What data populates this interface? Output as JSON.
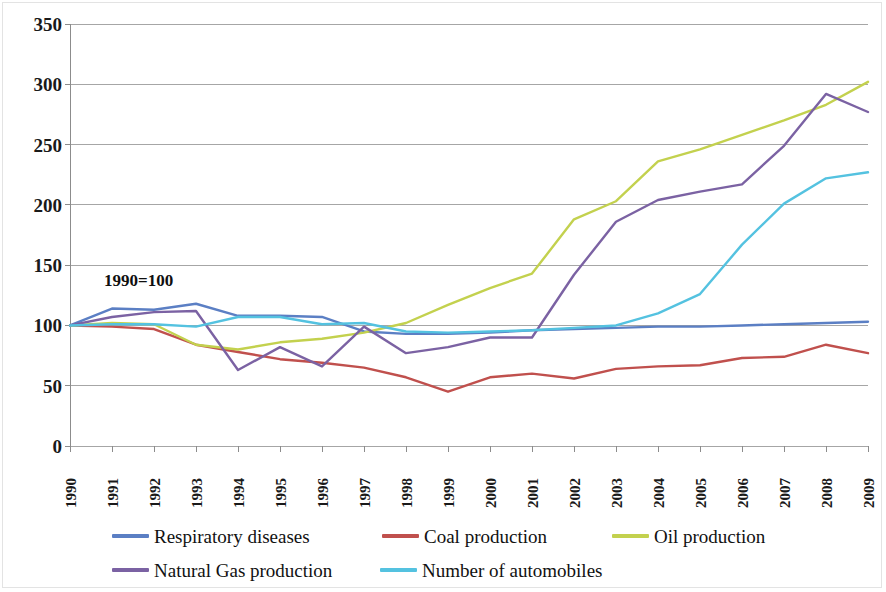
{
  "chart_data": {
    "type": "line",
    "title": "",
    "subtitle": "",
    "xlabel": "",
    "ylabel": "",
    "annotation": "1990=100",
    "grid": true,
    "legend_position": "bottom",
    "xlim": [
      1990,
      2009
    ],
    "ylim": [
      0,
      350
    ],
    "ytick_step": 50,
    "y_ticks": [
      "350",
      "300",
      "250",
      "200",
      "150",
      "100",
      "50",
      "0"
    ],
    "y_tick_values": [
      350,
      300,
      250,
      200,
      150,
      100,
      50,
      0
    ],
    "categories": [
      "1990",
      "1991",
      "1992",
      "1993",
      "1994",
      "1995",
      "1996",
      "1997",
      "1998",
      "1999",
      "2000",
      "2001",
      "2002",
      "2003",
      "2004",
      "2005",
      "2006",
      "2007",
      "2008",
      "2009"
    ],
    "series": [
      {
        "name": "Respiratory diseases",
        "color": "#5b7fc4",
        "values": [
          100,
          114,
          113,
          118,
          108,
          108,
          107,
          95,
          93,
          93,
          94,
          96,
          97,
          98,
          99,
          99,
          100,
          101,
          102,
          103
        ]
      },
      {
        "name": "Coal production",
        "color": "#c0504d",
        "values": [
          100,
          99,
          97,
          84,
          78,
          72,
          69,
          65,
          57,
          45,
          57,
          60,
          56,
          64,
          66,
          67,
          73,
          74,
          84,
          77
        ]
      },
      {
        "name": "Oil production",
        "color": "#c3d14e",
        "values": [
          100,
          102,
          101,
          84,
          80,
          86,
          89,
          94,
          102,
          117,
          131,
          143,
          188,
          203,
          236,
          246,
          258,
          270,
          283,
          302
        ]
      },
      {
        "name": "Natural Gas production",
        "color": "#7b62a3",
        "values": [
          100,
          107,
          111,
          112,
          63,
          82,
          66,
          99,
          77,
          82,
          90,
          90,
          142,
          186,
          204,
          211,
          217,
          249,
          292,
          277
        ]
      },
      {
        "name": "Number of automobiles",
        "color": "#54c2e0",
        "values": [
          100,
          101,
          101,
          99,
          107,
          107,
          101,
          102,
          95,
          94,
          95,
          96,
          98,
          100,
          110,
          126,
          167,
          201,
          222,
          227
        ]
      }
    ]
  },
  "legend": {
    "rows": [
      [
        {
          "label": "Respiratory diseases",
          "series": 0
        },
        {
          "label": "Coal production",
          "series": 1
        },
        {
          "label": "Oil production",
          "series": 2
        }
      ],
      [
        {
          "label": "Natural Gas production",
          "series": 3
        },
        {
          "label": "Number of automobiles",
          "series": 4
        }
      ]
    ]
  },
  "colors": {
    "respiratory_diseases": "#5b7fc4",
    "coal_production": "#c0504d",
    "oil_production": "#c3d14e",
    "natural_gas_production": "#7b62a3",
    "number_of_automobiles": "#54c2e0",
    "gridline": "#a6a6a6",
    "axis": "#8c8c8c",
    "background": "#ffffff"
  }
}
